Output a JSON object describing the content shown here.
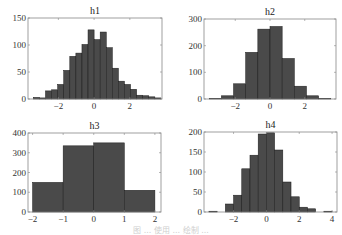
{
  "figure": {
    "caption": "图 ... 使用 ... 绘制 ..."
  },
  "chart_data": [
    {
      "type": "bar",
      "title": "h1",
      "xlabel": "",
      "ylabel": "",
      "xlim": [
        -3.7,
        3.8
      ],
      "ylim": [
        0,
        150
      ],
      "xticks": [
        -2,
        0,
        2
      ],
      "yticks": [
        0,
        50,
        100,
        150
      ],
      "bin_edges": [
        -3.4,
        -3.06,
        -2.72,
        -2.38,
        -2.04,
        -1.7,
        -1.36,
        -1.02,
        -0.68,
        -0.34,
        0.0,
        0.34,
        0.68,
        1.02,
        1.36,
        1.7,
        2.04,
        2.38,
        2.72,
        3.06,
        3.4,
        3.74
      ],
      "values": [
        3,
        2,
        15,
        17,
        27,
        53,
        79,
        85,
        101,
        128,
        110,
        124,
        95,
        57,
        33,
        27,
        18,
        7,
        6,
        4,
        2
      ],
      "grid": false
    },
    {
      "type": "bar",
      "title": "h2",
      "xlabel": "",
      "ylabel": "",
      "xlim": [
        -3.8,
        3.8
      ],
      "ylim": [
        0,
        300
      ],
      "xticks": [
        -2,
        0,
        2
      ],
      "yticks": [
        0,
        100,
        200,
        300
      ],
      "bin_edges": [
        -3.5,
        -2.8,
        -2.1,
        -1.4,
        -0.7,
        0.0,
        0.7,
        1.4,
        2.1,
        2.8,
        3.5
      ],
      "values": [
        2,
        12,
        57,
        175,
        262,
        272,
        152,
        48,
        12,
        2
      ],
      "grid": false
    },
    {
      "type": "bar",
      "title": "h3",
      "xlabel": "",
      "ylabel": "",
      "xlim": [
        -2.15,
        2.2
      ],
      "ylim": [
        0,
        400
      ],
      "xticks": [
        -2,
        -1,
        0,
        1,
        2
      ],
      "yticks": [
        0,
        100,
        200,
        300,
        400
      ],
      "bin_edges": [
        -2,
        -1,
        0,
        1,
        2
      ],
      "values": [
        150,
        335,
        350,
        110
      ],
      "grid": false
    },
    {
      "type": "bar",
      "title": "h4",
      "xlabel": "",
      "ylabel": "",
      "xlim": [
        -3.8,
        4.3
      ],
      "ylim": [
        0,
        200
      ],
      "xticks": [
        -2,
        0,
        2,
        4
      ],
      "yticks": [
        0,
        50,
        100,
        150,
        200
      ],
      "bin_edges": [
        -3.5,
        -3.0,
        -2.5,
        -2.0,
        -1.5,
        -1.0,
        -0.5,
        0.0,
        0.5,
        1.0,
        1.5,
        2.0,
        2.5,
        3.0,
        3.5,
        4.0
      ],
      "values": [
        2,
        0,
        20,
        42,
        108,
        142,
        195,
        198,
        155,
        75,
        38,
        12,
        8,
        0,
        2
      ],
      "grid": false
    }
  ],
  "layout": {
    "panels": [
      {
        "left": 28,
        "top": 18,
        "right": 162,
        "bottom": 99
      },
      {
        "left": 204,
        "top": 19,
        "right": 336,
        "bottom": 99
      },
      {
        "left": 28,
        "top": 133,
        "right": 161,
        "bottom": 212
      },
      {
        "left": 204,
        "top": 132,
        "right": 337,
        "bottom": 212
      }
    ]
  }
}
